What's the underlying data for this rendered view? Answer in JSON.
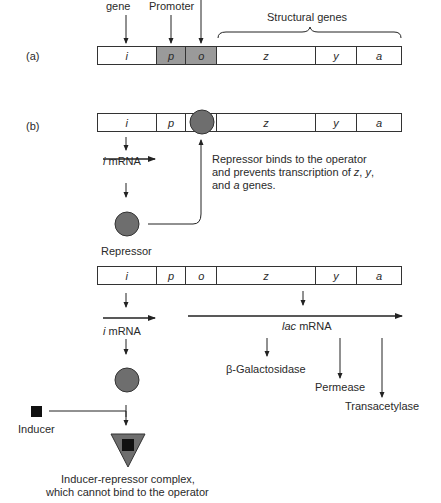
{
  "figure": {
    "top_labels": {
      "regulator_gene": "gene",
      "promoter": "Promoter",
      "structural_genes": "Structural genes"
    },
    "panel_a": {
      "label": "(a)",
      "segments": [
        {
          "name": "i",
          "shaded": false
        },
        {
          "name": "p",
          "shaded": true
        },
        {
          "name": "o",
          "shaded": true
        },
        {
          "name": "z",
          "shaded": false
        },
        {
          "name": "y",
          "shaded": false
        },
        {
          "name": "a",
          "shaded": false
        }
      ]
    },
    "panel_b": {
      "label": "(b)",
      "segments": [
        "i",
        "p",
        "o",
        "z",
        "y",
        "a"
      ],
      "i_mrna_prefix": "i",
      "i_mrna_label": "mRNA",
      "repressor_label": "Repressor",
      "annotation_lines": [
        "Repressor binds to the operator",
        "and prevents transcription of z, y,",
        "and a genes."
      ]
    },
    "panel_c": {
      "segments": [
        "i",
        "p",
        "o",
        "z",
        "y",
        "a"
      ],
      "i_mrna_prefix": "i",
      "i_mrna_label": "mRNA",
      "lac_mrna_prefix": "lac",
      "lac_mrna_label": "mRNA",
      "products": [
        "β-Galactosidase",
        "Permease",
        "Transacetylase"
      ],
      "inducer_label": "Inducer",
      "complex_label_lines": [
        "Inducer-repressor complex,",
        "which cannot bind to the operator"
      ]
    },
    "colors": {
      "repressor": "#6e6e6e",
      "shaded_region": "#9a9a9a",
      "inducer": "#111111",
      "line": "#222222"
    }
  }
}
